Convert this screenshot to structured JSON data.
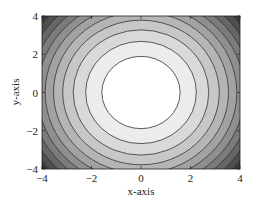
{
  "chart_data": {
    "type": "contour",
    "title": "",
    "xlabel": "x-axis",
    "ylabel": "y-axis",
    "xlim": [
      -4,
      4
    ],
    "ylim": [
      -4,
      4
    ],
    "xticks": [
      -4,
      -2,
      0,
      2,
      4
    ],
    "yticks": [
      -4,
      -2,
      0,
      2,
      4
    ],
    "xtick_labels": [
      "−4",
      "−2",
      "0",
      "2",
      "4"
    ],
    "ytick_labels": [
      "−4",
      "−2",
      "0",
      "2",
      "4"
    ],
    "grid": false,
    "legend": null,
    "colormap": "grayscale (light center, dark corners)",
    "function": "z = x^2 + 0.7*y^2",
    "levels": [
      2.5,
      5,
      7.5,
      10,
      12.5,
      15,
      17.5,
      20,
      22.5,
      25
    ],
    "level_fill_colors": [
      "#ffffff",
      "#ececec",
      "#d9d9d9",
      "#c7c7c7",
      "#b5b5b5",
      "#a2a2a2",
      "#8f8f8f",
      "#7b7b7b",
      "#666666",
      "#4f4f4f",
      "#383838"
    ],
    "contour_line_color": "#333333"
  },
  "plot_area": {
    "left": 42,
    "top": 16,
    "right": 240,
    "bottom": 169
  }
}
